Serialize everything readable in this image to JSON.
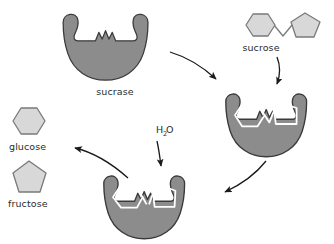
{
  "figure": {
    "background_color": "#ffffff",
    "enzyme_fill": "#8c8c8c",
    "enzyme_stroke": "#3a3a3a",
    "sugar_fill": "#d8d8d8",
    "sugar_stroke": "#7a7a7a",
    "bound_sugar_fill": "none",
    "bound_sugar_stroke": "#ffffff",
    "arrow_color": "#1a1a1a",
    "text_color": "#2b2b2b"
  },
  "labels": {
    "enzyme": "sucrase",
    "substrate": "sucrose",
    "reactant_water": "H",
    "reactant_water_sub": "2",
    "reactant_water_tail": "O",
    "product_glucose": "glucose",
    "product_fructose": "fructose"
  },
  "molecules": {
    "sucrose": {
      "name": "sucrose",
      "parts": [
        "glucose-hexagon",
        "fructose-pentagon"
      ],
      "state": "intact"
    },
    "glucose": {
      "name": "glucose",
      "shape": "hexagon"
    },
    "fructose": {
      "name": "fructose",
      "shape": "pentagon"
    }
  },
  "steps": [
    {
      "id": "free-enzyme",
      "label": "sucrase",
      "description": "free enzyme with active site notch"
    },
    {
      "id": "free-substrate",
      "label": "sucrose",
      "description": "intact sucrose disaccharide"
    },
    {
      "id": "enzyme-substrate-complex",
      "label": "",
      "description": "sucrose bound in active site"
    },
    {
      "id": "hydrolysis",
      "label": "H2O",
      "description": "water splits the glycosidic bond"
    },
    {
      "id": "products",
      "label": "glucose and fructose",
      "description": "monosaccharide products released"
    }
  ],
  "arrows": [
    {
      "id": "arrow-enzyme-to-complex",
      "from": "free-enzyme",
      "to": "enzyme-substrate-complex"
    },
    {
      "id": "arrow-substrate-to-complex",
      "from": "free-substrate",
      "to": "enzyme-substrate-complex"
    },
    {
      "id": "arrow-complex-to-hydrolysis",
      "from": "enzyme-substrate-complex",
      "to": "hydrolysis"
    },
    {
      "id": "arrow-water-in",
      "from": "water",
      "to": "hydrolysis"
    },
    {
      "id": "arrow-products-out",
      "from": "hydrolysis",
      "to": "products"
    }
  ]
}
